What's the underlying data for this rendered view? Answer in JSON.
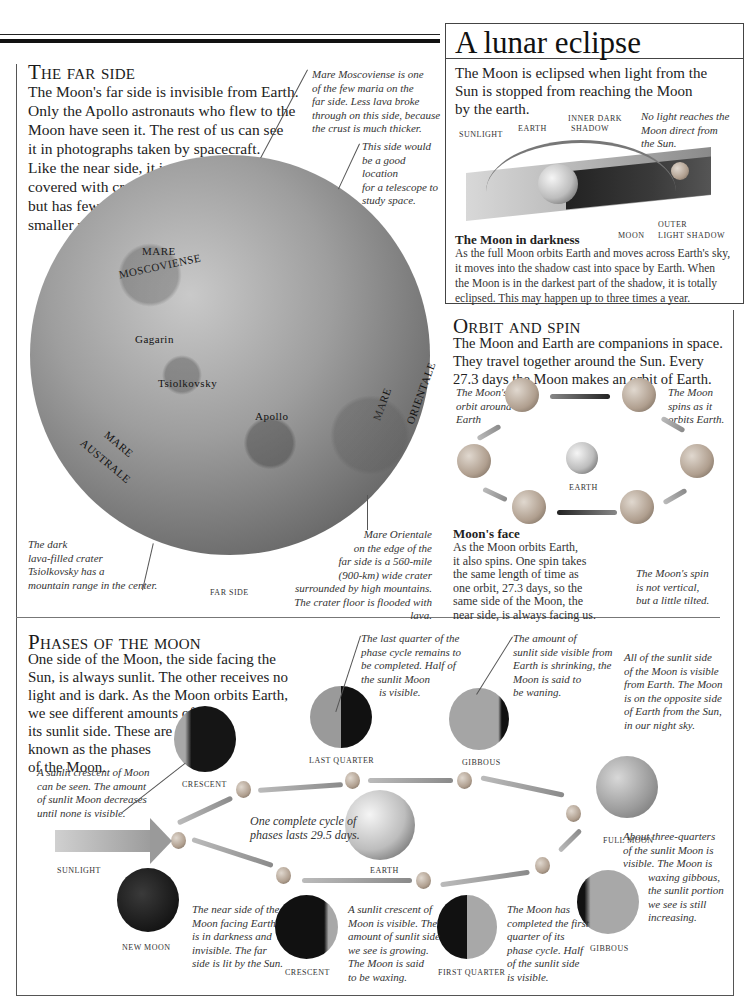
{
  "far_side": {
    "title": "The far side",
    "intro_lines": [
      "The Moon's far side is invisible from Earth.",
      "Only the Apollo astronauts who flew to the",
      "Moon have seen it. The rest of us can see",
      "it in photographs taken by spacecraft.",
      "Like the near side, it is",
      "covered with craters,",
      "but has fewer,",
      "smaller maria."
    ],
    "caption_moscoviense": [
      "Mare Moscoviense is one",
      "of the few maria on the",
      "far side. Less lava broke",
      "through on this side, because",
      "the crust is much thicker."
    ],
    "caption_telescope": [
      "This side would",
      "be a good location",
      "for a telescope to",
      "study space."
    ],
    "caption_tsiolkovsky": [
      "The dark",
      "lava-filled crater",
      "Tsiolkovsky has a",
      "mountain range in the center."
    ],
    "caption_orientale": [
      "Mare Orientale",
      "on the edge of the",
      "far side is a 560-mile",
      "(900-km) wide crater",
      "surrounded by high mountains.",
      "The crater floor is flooded with lava."
    ],
    "image_label": "FAR SIDE",
    "map_labels": {
      "moscoviense_1": "MARE",
      "moscoviense_2": "MOSCOVIENSE",
      "gagarin": "Gagarin",
      "tsiolkovsky": "Tsiolkovsky",
      "apollo": "Apollo",
      "australe_1": "MARE",
      "australe_2": "AUSTRALE",
      "orientale_1": "MARE",
      "orientale_2": "ORIENTALE"
    }
  },
  "eclipse": {
    "title": "A lunar eclipse",
    "intro_lines": [
      "The Moon is eclipsed when light from the",
      "Sun is stopped from reaching the Moon",
      "by the earth."
    ],
    "labels": {
      "sunlight": "SUNLIGHT",
      "earth": "EARTH",
      "inner_1": "INNER DARK",
      "inner_2": "SHADOW",
      "moon": "MOON",
      "outer_1": "OUTER",
      "outer_2": "LIGHT SHADOW"
    },
    "caption_no_light": [
      "No light reaches the",
      "Moon direct from",
      "the Sun."
    ],
    "subheading": "The Moon in darkness",
    "body_lines": [
      "As the full Moon orbits Earth and moves across Earth's sky,",
      "it moves into the shadow cast into space by Earth. When",
      "the Moon is in the darkest part of the shadow, it is totally",
      "eclipsed. This may happen up to three times a year."
    ]
  },
  "orbit": {
    "title": "Orbit and spin",
    "intro_lines": [
      "The Moon and Earth are companions in space.",
      "They travel together around the Sun. Every",
      "27.3 days the Moon makes an orbit of Earth."
    ],
    "caption_orbit": [
      "The Moon's",
      "orbit around",
      "Earth"
    ],
    "caption_spins": [
      "The Moon",
      "spins as it",
      "orbits Earth."
    ],
    "earth_label": "EARTH",
    "subheading": "Moon's face",
    "body_lines": [
      "As the Moon orbits Earth,",
      "it also spins. One spin takes",
      "the same length of time as",
      "one orbit, 27.3 days, so the",
      "same side of the Moon, the",
      "near side, is always facing us."
    ],
    "caption_tilt": [
      "The Moon's spin",
      "is not vertical,",
      "but a little tilted."
    ]
  },
  "phases": {
    "title": "Phases of the moon",
    "intro_lines": [
      "One side of the Moon, the side facing the",
      "Sun, is always sunlit. The other receives no",
      "light and is dark. As the Moon orbits Earth,",
      "we see different amounts of",
      "its sunlit side. These are",
      "known as the phases",
      "of the Moon."
    ],
    "labels": {
      "crescent_top": "CRESCENT",
      "last_quarter": "LAST QUARTER",
      "gibbous_top": "GIBBOUS",
      "full_moon": "FULL MOON",
      "sunlight": "SUNLIGHT",
      "earth": "EARTH",
      "new_moon": "NEW MOON",
      "crescent_bottom": "CRESCENT",
      "first_quarter": "FIRST QUARTER",
      "gibbous_bottom": "GIBBOUS"
    },
    "caption_waning_crescent": [
      "A sunlit crescent of Moon",
      "can be seen. The amount",
      "of sunlit Moon decreases",
      "until none is visible."
    ],
    "caption_last_quarter": [
      "The last quarter of the",
      "phase cycle remains to",
      "be completed. Half of",
      "the sunlit Moon",
      "is visible."
    ],
    "caption_waning_gibbous": [
      "The amount of",
      "sunlit side visible from",
      "Earth is shrinking, the",
      "Moon is said to",
      "be waning."
    ],
    "caption_full": [
      "All of the sunlit side",
      "of the Moon is visible",
      "from Earth. The Moon",
      "is on the opposite side",
      "of Earth from the Sun,",
      "in our night sky."
    ],
    "caption_cycle": [
      "One complete cycle of",
      "phases lasts 29.5 days."
    ],
    "caption_new": [
      "The near side of the",
      "Moon facing Earth",
      "is in darkness and",
      "invisible. The far",
      "side is lit by the Sun."
    ],
    "caption_waxing_crescent": [
      "A sunlit crescent of",
      "Moon is visible. The",
      "amount of sunlit side",
      "we see is growing.",
      "The Moon is said",
      "to be waxing."
    ],
    "caption_first_quarter": [
      "The Moon has",
      "completed the first",
      "quarter of its",
      "phase cycle. Half",
      "of the sunlit side",
      "is visible."
    ],
    "caption_waxing_gibbous": [
      "About three-quarters",
      "of the sunlit Moon is",
      "visible. The Moon is",
      "waxing gibbous,",
      "the sunlit portion",
      "we see is still",
      "increasing."
    ]
  }
}
